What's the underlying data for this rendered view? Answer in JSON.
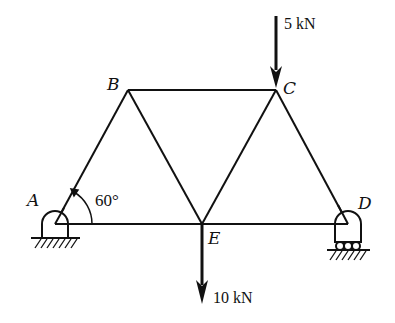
{
  "diagram": {
    "type": "truss",
    "nodes": [
      {
        "id": "A",
        "label": "A",
        "x": 55,
        "y": 224,
        "support": "pin"
      },
      {
        "id": "B",
        "label": "B",
        "x": 128,
        "y": 90
      },
      {
        "id": "C",
        "label": "C",
        "x": 276,
        "y": 90
      },
      {
        "id": "D",
        "label": "D",
        "x": 348,
        "y": 224,
        "support": "roller"
      },
      {
        "id": "E",
        "label": "E",
        "x": 202,
        "y": 224
      }
    ],
    "members": [
      [
        "A",
        "B"
      ],
      [
        "B",
        "C"
      ],
      [
        "A",
        "E"
      ],
      [
        "E",
        "D"
      ],
      [
        "B",
        "E"
      ],
      [
        "E",
        "C"
      ],
      [
        "C",
        "D"
      ]
    ],
    "angle": {
      "label": "60°",
      "at": "A"
    },
    "loads": [
      {
        "node": "C",
        "label": "5 kN",
        "direction": "down"
      },
      {
        "node": "E",
        "label": "10 kN",
        "direction": "down"
      }
    ]
  }
}
